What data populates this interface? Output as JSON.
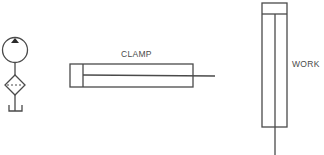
{
  "diagram": {
    "type": "hydraulic-schematic",
    "components": [
      {
        "id": "pump",
        "kind": "hydraulic-pump",
        "symbol": "circle-with-filled-triangle"
      },
      {
        "id": "filter",
        "kind": "filter",
        "symbol": "diamond-with-dashed-line"
      },
      {
        "id": "tank",
        "kind": "reservoir",
        "symbol": "open-tank"
      },
      {
        "id": "clamp_cylinder",
        "kind": "single-rod-cylinder",
        "orientation": "horizontal",
        "label": "CLAMP"
      },
      {
        "id": "work_cylinder",
        "kind": "single-rod-cylinder",
        "orientation": "vertical",
        "label": "WORK"
      }
    ]
  },
  "labels": {
    "clamp": "CLAMP",
    "work": "WORK"
  },
  "colors": {
    "line": "#4a4a4a",
    "background": "#ffffff"
  }
}
